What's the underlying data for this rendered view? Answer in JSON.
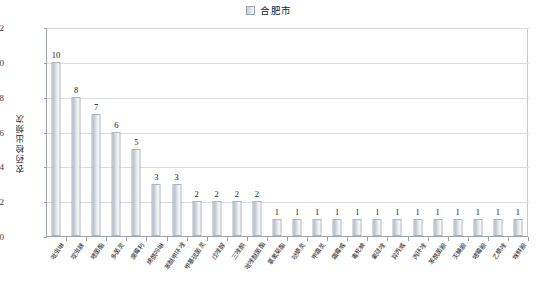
{
  "legend": {
    "swatch_icon": "legend-swatch-icon",
    "label": "合肥市"
  },
  "axes": {
    "y_title": "农药检出频次",
    "y_ticks": [
      "0",
      "2",
      "4",
      "6",
      "8",
      "10",
      "12"
    ],
    "x_title": ""
  },
  "chart_data": {
    "type": "bar",
    "title": "",
    "xlabel": "",
    "ylabel": "农药检出频次",
    "ylim": [
      0,
      12
    ],
    "ytick_values": [
      0,
      2,
      4,
      6,
      8,
      10,
      12
    ],
    "grid": true,
    "legend_position": "top-center",
    "series": [
      {
        "name": "合肥市",
        "values": [
          10,
          8,
          7,
          6,
          5,
          3,
          3,
          2,
          2,
          2,
          2,
          1,
          1,
          1,
          1,
          1,
          1,
          1,
          1,
          1,
          1,
          1,
          1,
          1
        ]
      }
    ],
    "categories": [
      "吡虫啉",
      "啶虫脒",
      "嘧菌酯",
      "多菌灵",
      "腐霉利",
      "烯酰吗啉",
      "苯醚甲环唑",
      "甲基硫菌灵",
      "戊唑醇",
      "三唑酮",
      "吡唑醚菌酯",
      "氯氰菊酯",
      "哒螨灵",
      "甲霜灵",
      "霜霉威",
      "毒死蜱",
      "氟硅唑",
      "异丙威",
      "丙环唑",
      "苯酰菌胺",
      "灭蝇胺",
      "嘧霉胺",
      "乙螨唑",
      "咪鲜胺"
    ],
    "data_labels": [
      "10",
      "8",
      "7",
      "6",
      "5",
      "3",
      "3",
      "2",
      "2",
      "2",
      "2",
      "1",
      "1",
      "1",
      "1",
      "1",
      "1",
      "1",
      "1",
      "1",
      "1",
      "1",
      "1",
      "1"
    ]
  },
  "colors": {
    "bar_fill_dark": "#a9b2bd",
    "bar_fill_light": "#fbfcfd",
    "bar_border": "#aeb6c0",
    "axis": "#9aa3ae",
    "gridline": "#d9dde3",
    "text": "#1a1a1a"
  }
}
